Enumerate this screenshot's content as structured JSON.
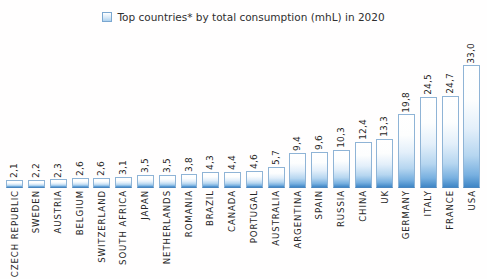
{
  "legend": {
    "label": "Top countries* by total consumption (mhL) in 2020",
    "swatch_name": "legend-swatch",
    "swatch_color": "#aed2ef"
  },
  "ghost_title": "",
  "chart_data": {
    "type": "bar",
    "title": "Top countries* by total consumption (mhL) in 2020",
    "xlabel": "",
    "ylabel": "",
    "ylim": [
      0,
      35
    ],
    "grid": false,
    "legend_position": "top-center",
    "decimal_separator": ",",
    "series_name": "Top countries* by total consumption (mhL) in 2020",
    "bar_color": "#3f86c6",
    "categories": [
      "CZECH REPUBLIC",
      "SWEDEN",
      "AUSTRIA",
      "BELGIUM",
      "SWITZERLAND",
      "SOUTH AFRICA",
      "JAPAN",
      "NETHERLANDS",
      "ROMANIA",
      "BRAZIL",
      "CANADA",
      "PORTUGAL",
      "AUSTRALIA",
      "ARGENTINA",
      "SPAIN",
      "RUSSIA",
      "CHINA",
      "UK",
      "GERMANY",
      "ITALY",
      "FRANCE",
      "USA"
    ],
    "values": [
      2.1,
      2.2,
      2.3,
      2.6,
      2.6,
      3.1,
      3.5,
      3.5,
      3.8,
      4.3,
      4.4,
      4.6,
      5.7,
      9.4,
      9.6,
      10.3,
      12.4,
      13.3,
      19.8,
      24.5,
      24.7,
      33.0
    ],
    "value_labels": [
      "2,1",
      "2,2",
      "2,3",
      "2,6",
      "2,6",
      "3,1",
      "3,5",
      "3,5",
      "3,8",
      "4,3",
      "4,4",
      "4,6",
      "5,7",
      "9,4",
      "9,6",
      "10,3",
      "12,4",
      "13,3",
      "19,8",
      "24,5",
      "24,7",
      "33,0"
    ]
  }
}
